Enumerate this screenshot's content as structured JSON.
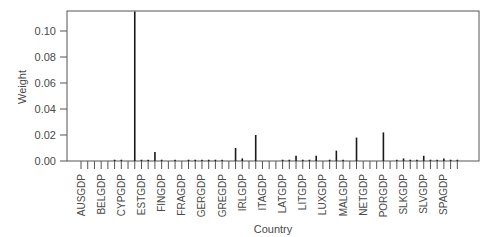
{
  "chart_data": {
    "type": "bar",
    "style": "needle",
    "title": "",
    "xlabel": "Country",
    "ylabel": "Weight",
    "ylim": [
      0,
      0.115
    ],
    "yticks": [
      0.0,
      0.02,
      0.04,
      0.06,
      0.08,
      0.1
    ],
    "ytick_labels": [
      "0.00",
      "0.02",
      "0.04",
      "0.06",
      "0.08",
      "0.10"
    ],
    "grid": false,
    "legend": null,
    "tick_labels_every": 3,
    "visible_category_labels": [
      "AUSGDP",
      "BELGDP",
      "CYPGDP",
      "ESTGDP",
      "FINGDP",
      "FRAGDP",
      "GERGDP",
      "GREGDP",
      "IRLGDP",
      "ITAGDP",
      "LATGDP",
      "LITGDP",
      "LUXGDP",
      "MALGDP",
      "NETGDP",
      "PORGDP",
      "SLKGDP",
      "SLVGDP",
      "SPAGDP"
    ],
    "n_categories": 57,
    "values": [
      0.0,
      0.0,
      0.0,
      0.0,
      0.0,
      0.001,
      0.001,
      0.0,
      0.115,
      0.001,
      0.001,
      0.007,
      0.001,
      0.0,
      0.001,
      0.0,
      0.001,
      0.001,
      0.001,
      0.001,
      0.001,
      0.001,
      0.0,
      0.01,
      0.002,
      0.0,
      0.02,
      0.0,
      0.0,
      0.0,
      0.001,
      0.001,
      0.004,
      0.001,
      0.001,
      0.004,
      0.0,
      0.001,
      0.008,
      0.001,
      0.0,
      0.018,
      0.0,
      0.0,
      0.0,
      0.022,
      0.0,
      0.001,
      0.002,
      0.001,
      0.001,
      0.004,
      0.001,
      0.001,
      0.002,
      0.001,
      0.001
    ]
  },
  "colors": {
    "bar": "#1a1a1a",
    "axis": "#555555",
    "text": "#4a4a4a"
  }
}
